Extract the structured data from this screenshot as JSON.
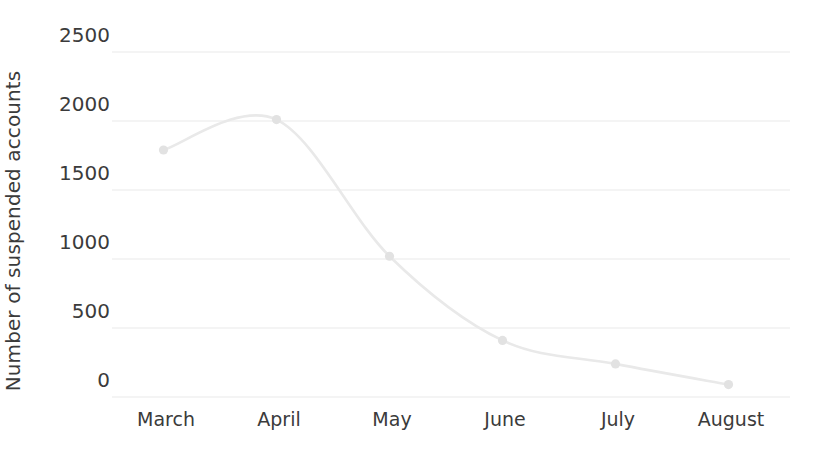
{
  "chart_data": {
    "type": "line",
    "title": "",
    "xlabel": "",
    "ylabel": "Number of suspended accounts",
    "categories": [
      "March",
      "April",
      "May",
      "June",
      "July",
      "August"
    ],
    "values": [
      1790,
      2010,
      1020,
      410,
      240,
      90
    ],
    "series": [
      {
        "name": "Number of suspended accounts",
        "values": [
          1790,
          2010,
          1020,
          410,
          240,
          90
        ]
      }
    ],
    "ylim": [
      0,
      2500
    ],
    "yticks": [
      0,
      500,
      1000,
      1500,
      2000,
      2500
    ],
    "ytick_labels": [
      "0",
      "500",
      "1000",
      "1500",
      "2000",
      "2500"
    ],
    "grid": true,
    "grid_axis": "y",
    "legend": "none",
    "line_color": "#e9e9e9",
    "marker_color": "#e2e2e2",
    "grid_color": "#eaeaea",
    "background_color": "#ffffff",
    "text_color": "#3b3b3b",
    "smoothing": "spline"
  }
}
